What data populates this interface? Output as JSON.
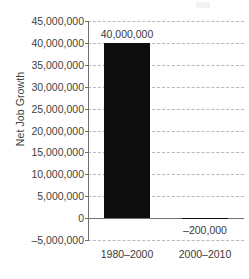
{
  "chart_data": {
    "type": "bar",
    "title": "",
    "subtitle": "",
    "xlabel": "",
    "ylabel": "Net Job Growth",
    "categories": [
      "1980–2000",
      "2000–2010"
    ],
    "values": [
      40000000,
      -200000
    ],
    "data_labels": [
      "40,000,000",
      "–200,000"
    ],
    "ylim": [
      -5000000,
      45000000
    ],
    "ytick_values": [
      45000000,
      40000000,
      35000000,
      30000000,
      25000000,
      20000000,
      15000000,
      10000000,
      5000000,
      0,
      -5000000
    ],
    "ytick_labels": [
      "45,000,000",
      "40,000,000",
      "35,000,000",
      "30,000,000",
      "25,000,000",
      "20,000,000",
      "15,000,000",
      "10,000,000",
      "5,000,000",
      "0",
      "–5,000,000"
    ],
    "grid": true,
    "gridline_style": "dashed",
    "legend": false,
    "legend_position": "none",
    "bar_color": "#0d0d0d",
    "gridline_color": "#b9b9b9",
    "axis_color": "#6f6f6f",
    "background_color": "#ffffff",
    "text_color": "#3a3a3a"
  }
}
